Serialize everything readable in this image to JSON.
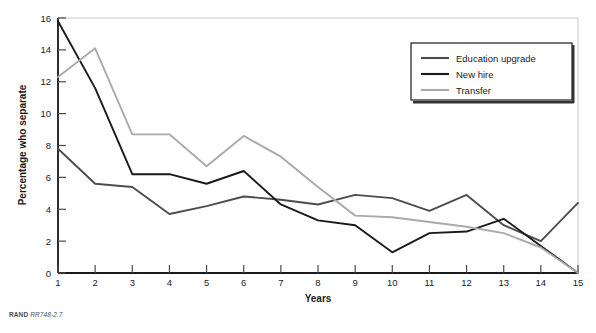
{
  "figure": {
    "source_note_brand": "RAND",
    "source_note_ref": "RR748-2.7"
  },
  "chart_data": {
    "type": "line",
    "title": "",
    "xlabel": "Years",
    "ylabel": "Percentage who separate",
    "x": [
      1,
      2,
      3,
      4,
      5,
      6,
      7,
      8,
      9,
      10,
      11,
      12,
      13,
      14,
      15
    ],
    "xticklabels": [
      "1",
      "2",
      "3",
      "4",
      "5",
      "6",
      "7",
      "8",
      "9",
      "10",
      "11",
      "12",
      "13",
      "14",
      "15"
    ],
    "yticks": [
      0,
      2,
      4,
      6,
      8,
      10,
      12,
      14,
      16
    ],
    "yticklabels": [
      "0",
      "2",
      "4",
      "6",
      "8",
      "10",
      "12",
      "14",
      "16"
    ],
    "xlim": [
      1,
      15
    ],
    "ylim": [
      0,
      16
    ],
    "grid": false,
    "legend_position": "top-right",
    "series": [
      {
        "name": "Education upgrade",
        "color": "#4d4d4d",
        "values": [
          7.8,
          5.6,
          5.4,
          3.7,
          4.2,
          4.8,
          4.6,
          4.3,
          4.9,
          4.7,
          3.9,
          4.9,
          3.0,
          2.0,
          4.4
        ]
      },
      {
        "name": "New hire",
        "color": "#1a1a1a",
        "values": [
          15.8,
          11.6,
          6.2,
          6.2,
          5.6,
          6.4,
          4.3,
          3.3,
          3.0,
          1.3,
          2.5,
          2.6,
          3.4,
          1.7,
          0.0
        ]
      },
      {
        "name": "Transfer",
        "color": "#aaaaaa",
        "values": [
          12.3,
          14.1,
          8.7,
          8.7,
          6.7,
          8.6,
          7.3,
          5.4,
          3.6,
          3.5,
          3.2,
          2.9,
          2.5,
          1.6,
          0.0
        ]
      }
    ]
  }
}
